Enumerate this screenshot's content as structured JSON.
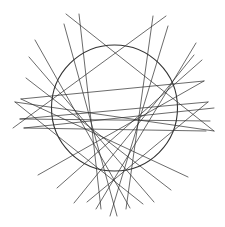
{
  "colors": {
    "background": "#ffffff",
    "stroke": "#2b2b2b",
    "circle": "#333333"
  },
  "diagram": {
    "circle": {
      "cx": 114.5,
      "cy": 108,
      "r": 63
    },
    "lines": [
      {
        "x1": 66,
        "y1": 14,
        "x2": 214,
        "y2": 131
      },
      {
        "x1": 166,
        "y1": 16,
        "x2": 13,
        "y2": 128
      },
      {
        "x1": 79,
        "y1": 14,
        "x2": 101,
        "y2": 209
      },
      {
        "x1": 153,
        "y1": 16,
        "x2": 126,
        "y2": 209
      },
      {
        "x1": 64,
        "y1": 24,
        "x2": 117,
        "y2": 216
      },
      {
        "x1": 168,
        "y1": 26,
        "x2": 110,
        "y2": 216
      },
      {
        "x1": 35,
        "y1": 40,
        "x2": 130,
        "y2": 208
      },
      {
        "x1": 196,
        "y1": 43,
        "x2": 96,
        "y2": 209
      },
      {
        "x1": 29,
        "y1": 57,
        "x2": 154,
        "y2": 202
      },
      {
        "x1": 194,
        "y1": 55,
        "x2": 74,
        "y2": 203
      },
      {
        "x1": 202,
        "y1": 60,
        "x2": 57,
        "y2": 188
      },
      {
        "x1": 26,
        "y1": 78,
        "x2": 171,
        "y2": 190
      },
      {
        "x1": 204,
        "y1": 81,
        "x2": 38,
        "y2": 175
      },
      {
        "x1": 21,
        "y1": 99,
        "x2": 188,
        "y2": 177
      },
      {
        "x1": 208,
        "y1": 102,
        "x2": 87,
        "y2": 202
      },
      {
        "x1": 15,
        "y1": 102,
        "x2": 143,
        "y2": 204
      },
      {
        "x1": 20,
        "y1": 119,
        "x2": 208,
        "y2": 102
      },
      {
        "x1": 214,
        "y1": 108,
        "x2": 24,
        "y2": 128
      },
      {
        "x1": 20,
        "y1": 119,
        "x2": 210,
        "y2": 121
      },
      {
        "x1": 24,
        "y1": 128,
        "x2": 206,
        "y2": 131
      },
      {
        "x1": 15,
        "y1": 102,
        "x2": 214,
        "y2": 131
      },
      {
        "x1": 21,
        "y1": 99,
        "x2": 204,
        "y2": 81
      }
    ]
  }
}
